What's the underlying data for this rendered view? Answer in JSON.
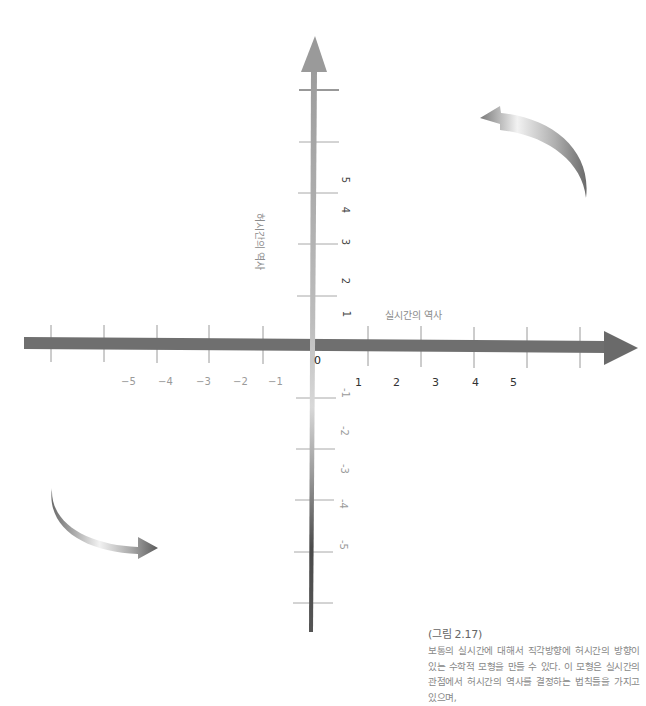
{
  "figure": {
    "horizontal_axis": {
      "title": "실시간의 역사",
      "negative_labels": [
        "−5",
        "−4",
        "−3",
        "−2",
        "−1"
      ],
      "positive_labels": [
        "1",
        "2",
        "3",
        "4",
        "5"
      ],
      "origin_label": "0",
      "color": "#6e6e6e"
    },
    "vertical_axis": {
      "title": "허시간의 역사",
      "positive_labels": [
        "5",
        "4",
        "3",
        "2",
        "1"
      ],
      "negative_labels": [
        "-1",
        "-2",
        "-3",
        "-4",
        "-5"
      ],
      "gradient_top": "#9a9a9a",
      "gradient_mid": "#d6d6d6",
      "gradient_bottom": "#3a3a3a"
    },
    "rotation_arrows": [
      {
        "name": "upper-right-curved-arrow",
        "direction": "counterclockwise-left"
      },
      {
        "name": "lower-left-curved-arrow",
        "direction": "clockwise-right"
      }
    ]
  },
  "caption": {
    "title": "(그림 2.17)",
    "body": "보통의 실시간에 대해서 직각방향에 허시간의 방향이 있는 수학적 모형을 만들 수 있다. 이 모형은 실시간의 관점에서 허시간의 역사를 결정하는 법칙들을 가지고 있으며,"
  }
}
